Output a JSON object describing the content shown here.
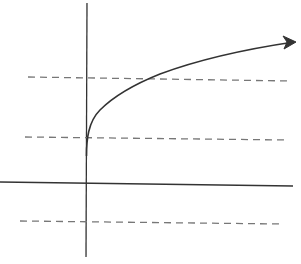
{
  "diagram": {
    "colors": {
      "background": "#ffffff",
      "axis": "#333333",
      "curve": "#333333",
      "dashed": "#777777"
    },
    "axes": {
      "y_axis": {
        "x1": 87,
        "y1": 3,
        "x2": 86,
        "y2": 257
      },
      "x_axis": {
        "x1": 0,
        "y1": 182,
        "x2": 293,
        "y2": 186
      }
    },
    "dashed_lines": [
      {
        "x1": 28,
        "y1": 77,
        "x2": 290,
        "y2": 81
      },
      {
        "x1": 25,
        "y1": 137,
        "x2": 287,
        "y2": 140
      },
      {
        "x1": 20,
        "y1": 221,
        "x2": 282,
        "y2": 224
      }
    ],
    "curve": {
      "path": "M 86.5 156 C 86.5 140, 88 122, 100 110 C 115 95, 135 84, 160 74 C 195 61, 240 50, 294 42",
      "arrowhead": "M 283 36 L 296 42 L 284 49 L 287 42 Z"
    }
  }
}
